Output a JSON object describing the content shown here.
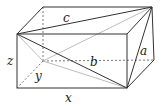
{
  "diagram": {
    "type": "rectangular-box-diagonals",
    "labels": {
      "a": "a",
      "b": "b",
      "c": "c",
      "x": "x",
      "y": "y",
      "z": "z"
    },
    "colors": {
      "edge": "#333333",
      "diagonal_light": "#b0b0b0",
      "hidden_edge": "#555555"
    }
  }
}
